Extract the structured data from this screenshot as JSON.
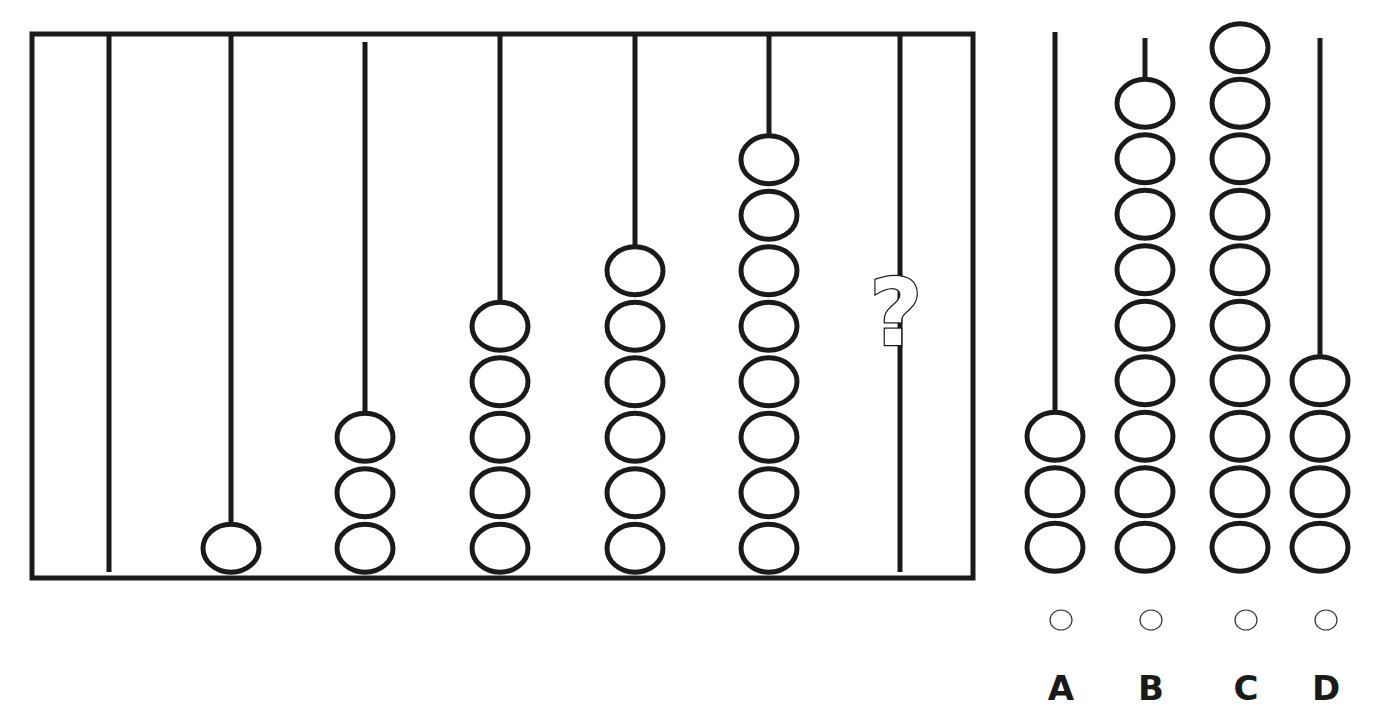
{
  "puzzle": {
    "type": "abacus-sequence",
    "question_mark": "?",
    "frame": {
      "x": 32,
      "y": 34,
      "width": 941,
      "height": 544
    },
    "rods": [
      {
        "x": 109,
        "top": 36,
        "beads": 0
      },
      {
        "x": 231,
        "top": 36,
        "beads": 1
      },
      {
        "x": 365,
        "top": 42,
        "beads": 3
      },
      {
        "x": 500,
        "top": 36,
        "beads": 5
      },
      {
        "x": 635,
        "top": 36,
        "beads": 6
      },
      {
        "x": 769,
        "top": 36,
        "beads": 8
      },
      {
        "x": 900,
        "top": 36,
        "beads": null,
        "unknown": true
      }
    ],
    "sequence": [
      0,
      1,
      3,
      5,
      6,
      8,
      "?"
    ]
  },
  "options": [
    {
      "label": "A",
      "x": 1055,
      "top": 32,
      "beads": 3
    },
    {
      "label": "B",
      "x": 1145,
      "top": 38,
      "beads": 9
    },
    {
      "label": "C",
      "x": 1240,
      "top": 38,
      "beads": 10
    },
    {
      "label": "D",
      "x": 1320,
      "top": 38,
      "beads": 4
    }
  ],
  "bead": {
    "rx": 28,
    "ry": 24,
    "spacing": 55.5
  },
  "colors": {
    "ink": "#1a1a1a",
    "background": "#ffffff"
  }
}
